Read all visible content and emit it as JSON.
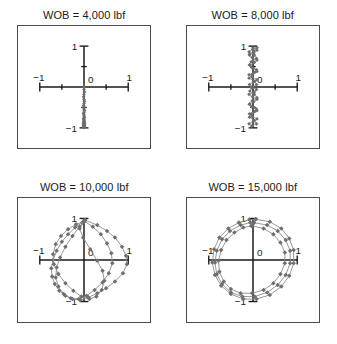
{
  "figure": {
    "background_color": "#ffffff",
    "frame_color": "#4a4a4a",
    "axis_color": "#1a1a1a",
    "marker_color": "#6e6e6e",
    "line_color": "#8a8a8a"
  },
  "panels": [
    {
      "id": "panel-wob-4000",
      "title": "WOB = 4,000 lbf",
      "tick_labels": {
        "x_min": "−1",
        "x_max": "1",
        "y_min": "−1",
        "y_max": "1",
        "origin": "0"
      }
    },
    {
      "id": "panel-wob-8000",
      "title": "WOB = 8,000 lbf",
      "tick_labels": {
        "x_min": "−1",
        "x_max": "1",
        "y_min": "−1",
        "y_max": "1",
        "origin": "0"
      }
    },
    {
      "id": "panel-wob-10000",
      "title": "WOB = 10,000 lbf",
      "tick_labels": {
        "x_min": "−1",
        "x_max": "1",
        "y_min": "−1",
        "y_max": "1",
        "origin": "0"
      }
    },
    {
      "id": "panel-wob-15000",
      "title": "WOB = 15,000 lbf",
      "tick_labels": {
        "x_min": "−1",
        "x_max": "1",
        "y_min": "−1",
        "y_max": "1",
        "origin": "0"
      }
    }
  ],
  "chart_data": [
    {
      "type": "scatter",
      "title": "WOB = 4,000 lbf",
      "xlabel": "",
      "ylabel": "",
      "xlim": [
        -1,
        1
      ],
      "ylim": [
        -1,
        1
      ],
      "xticks": [
        -1,
        -0.5,
        0,
        0.5,
        1
      ],
      "xticklabels": [
        "−1",
        "",
        "0",
        "",
        "1"
      ],
      "yticks": [
        -1,
        -0.5,
        0,
        0.5,
        1
      ],
      "yticklabels": [
        "−1",
        "",
        "",
        "",
        "1"
      ],
      "grid": false,
      "legend": false,
      "marker": "diamond",
      "series": [
        {
          "name": "bit-center-orbit",
          "x": [
            0.0,
            0.0,
            0.01,
            0.0,
            -0.01,
            0.0,
            0.01,
            0.0,
            -0.01,
            0.0,
            0.0,
            0.01,
            0.0,
            -0.01,
            0.0,
            0.0,
            0.01,
            0.0,
            -0.01,
            0.0,
            0.0,
            0.0,
            0.01,
            0.0,
            -0.01,
            0.0,
            0.0,
            0.01,
            0.0,
            -0.01,
            0.0,
            0.0,
            0.01,
            0.0,
            -0.01,
            0.0,
            0.0,
            0.0,
            0.01,
            0.0,
            0.0,
            -0.01,
            0.0,
            0.0,
            0.01,
            0.0,
            -0.01,
            0.0,
            0.0,
            0.0
          ],
          "y": [
            0.0,
            -0.06,
            -0.12,
            -0.18,
            -0.24,
            -0.3,
            -0.35,
            -0.4,
            -0.45,
            -0.5,
            -0.54,
            -0.58,
            -0.62,
            -0.65,
            -0.68,
            -0.71,
            -0.74,
            -0.76,
            -0.78,
            -0.8,
            -0.82,
            -0.84,
            -0.85,
            -0.86,
            -0.87,
            -0.88,
            -0.89,
            -0.9,
            -0.91,
            -0.92,
            -0.92,
            -0.93,
            -0.93,
            -0.94,
            -0.94,
            -0.95,
            -0.95,
            -0.96,
            -0.96,
            -0.96,
            -0.97,
            -0.97,
            -0.97,
            -0.98,
            -0.98,
            -0.98,
            -0.98,
            -0.99,
            -0.99,
            -0.99
          ]
        }
      ]
    },
    {
      "type": "scatter",
      "title": "WOB = 8,000 lbf",
      "xlabel": "",
      "ylabel": "",
      "xlim": [
        -1,
        1
      ],
      "ylim": [
        -1,
        1
      ],
      "xticks": [
        -1,
        -0.5,
        0,
        0.5,
        1
      ],
      "xticklabels": [
        "−1",
        "",
        "0",
        "",
        "1"
      ],
      "yticks": [
        -1,
        -0.5,
        0,
        0.5,
        1
      ],
      "yticklabels": [
        "−1",
        "",
        "",
        "",
        "1"
      ],
      "grid": false,
      "legend": false,
      "marker": "diamond",
      "series": [
        {
          "name": "bit-center-orbit",
          "x": [
            0.0,
            0.09,
            0.02,
            -0.08,
            -0.02,
            0.09,
            0.03,
            -0.07,
            -0.03,
            0.08,
            0.04,
            -0.09,
            -0.02,
            0.09,
            0.01,
            -0.08,
            -0.04,
            0.08,
            0.03,
            -0.09,
            -0.01,
            0.09,
            0.02,
            -0.08,
            -0.03,
            0.08,
            0.04,
            -0.08,
            -0.02,
            0.09,
            0.01,
            -0.09,
            -0.03,
            0.08,
            0.03,
            -0.08,
            -0.04,
            0.09,
            0.02,
            -0.08,
            -0.02,
            0.09,
            0.03,
            -0.07,
            -0.03,
            0.08,
            0.04,
            -0.09,
            -0.02,
            0.09,
            0.01,
            -0.08,
            -0.04,
            0.08,
            0.03,
            -0.09,
            -0.01,
            0.09,
            0.02,
            -0.08
          ],
          "y": [
            0.96,
            0.9,
            0.84,
            0.78,
            0.72,
            0.66,
            0.6,
            0.54,
            0.48,
            0.42,
            0.36,
            0.3,
            0.24,
            0.18,
            0.12,
            0.06,
            0.0,
            -0.06,
            -0.12,
            -0.18,
            -0.24,
            -0.3,
            -0.36,
            -0.42,
            -0.48,
            -0.54,
            -0.6,
            -0.66,
            -0.72,
            -0.78,
            -0.84,
            -0.9,
            -0.96,
            -0.9,
            -0.82,
            -0.74,
            -0.66,
            -0.58,
            -0.5,
            -0.42,
            -0.34,
            -0.26,
            -0.18,
            -0.1,
            -0.02,
            0.06,
            0.14,
            0.22,
            0.3,
            0.38,
            0.46,
            0.54,
            0.62,
            0.7,
            0.78,
            0.86,
            0.92,
            0.96,
            0.88,
            0.8
          ]
        }
      ]
    },
    {
      "type": "scatter",
      "title": "WOB = 10,000 lbf",
      "xlabel": "",
      "ylabel": "",
      "xlim": [
        -1,
        1
      ],
      "ylim": [
        -1,
        1
      ],
      "xticks": [
        -1,
        0,
        1
      ],
      "xticklabels": [
        "−1",
        "0",
        "1"
      ],
      "yticks": [
        -1,
        1
      ],
      "yticklabels": [
        "−1",
        "1"
      ],
      "grid": false,
      "legend": false,
      "marker": "diamond",
      "series": [
        {
          "name": "orbit-loop-outer",
          "x": [
            0.02,
            0.3,
            0.52,
            0.7,
            0.86,
            0.95,
            0.97,
            0.88,
            0.7,
            0.5,
            0.3,
            0.1,
            -0.08,
            -0.26,
            -0.42,
            -0.56,
            -0.66,
            -0.72,
            -0.74,
            -0.7,
            -0.62,
            -0.5,
            -0.36,
            -0.2,
            -0.04,
            0.02
          ],
          "y": [
            0.96,
            0.84,
            0.7,
            0.54,
            0.32,
            0.1,
            -0.1,
            -0.32,
            -0.52,
            -0.68,
            -0.8,
            -0.9,
            -0.96,
            -0.94,
            -0.86,
            -0.74,
            -0.58,
            -0.4,
            -0.2,
            0.0,
            0.22,
            0.44,
            0.62,
            0.78,
            0.9,
            0.96
          ]
        },
        {
          "name": "orbit-loop-inner",
          "x": [
            0.0,
            0.2,
            0.38,
            0.52,
            0.62,
            0.64,
            0.56,
            0.42,
            0.24,
            0.06,
            -0.12,
            -0.3,
            -0.46,
            -0.58,
            -0.64,
            -0.62,
            -0.54,
            -0.42,
            -0.26,
            -0.1,
            0.0
          ],
          "y": [
            0.94,
            0.8,
            0.62,
            0.4,
            0.16,
            -0.08,
            -0.32,
            -0.54,
            -0.72,
            -0.86,
            -0.94,
            -0.92,
            -0.82,
            -0.64,
            -0.42,
            -0.18,
            0.06,
            0.32,
            0.58,
            0.8,
            0.94
          ]
        },
        {
          "name": "orbit-loop-cross",
          "x": [
            0.0,
            -0.18,
            -0.36,
            -0.52,
            -0.64,
            -0.7,
            -0.68,
            -0.58,
            -0.42,
            -0.24,
            -0.06,
            0.12,
            0.28,
            0.4,
            0.46,
            0.42,
            0.3,
            0.14,
            -0.02,
            -0.1,
            0.0
          ],
          "y": [
            0.92,
            0.86,
            0.74,
            0.58,
            0.38,
            0.14,
            -0.1,
            -0.34,
            -0.56,
            -0.74,
            -0.88,
            -0.94,
            -0.88,
            -0.72,
            -0.5,
            -0.26,
            -0.02,
            0.26,
            0.54,
            0.76,
            0.92
          ]
        }
      ]
    },
    {
      "type": "scatter",
      "title": "WOB = 15,000 lbf",
      "xlabel": "",
      "ylabel": "",
      "xlim": [
        -1,
        1
      ],
      "ylim": [
        -1,
        1
      ],
      "xticks": [
        -1,
        0,
        1
      ],
      "xticklabels": [
        "−1",
        "0",
        "1"
      ],
      "yticks": [
        -1,
        1
      ],
      "yticklabels": [
        "−1",
        "1"
      ],
      "grid": false,
      "legend": false,
      "marker": "diamond",
      "series": [
        {
          "name": "orbit-ring-outer",
          "x": [
            0.06,
            0.38,
            0.64,
            0.82,
            0.92,
            0.92,
            0.82,
            0.64,
            0.38,
            0.08,
            -0.22,
            -0.5,
            -0.72,
            -0.86,
            -0.92,
            -0.88,
            -0.76,
            -0.56,
            -0.32,
            -0.08,
            0.06
          ],
          "y": [
            0.98,
            0.92,
            0.76,
            0.52,
            0.24,
            -0.08,
            -0.38,
            -0.64,
            -0.84,
            -0.94,
            -0.94,
            -0.82,
            -0.62,
            -0.36,
            -0.06,
            0.26,
            0.54,
            0.76,
            0.9,
            0.97,
            0.98
          ]
        },
        {
          "name": "orbit-ring-middle",
          "x": [
            0.02,
            0.32,
            0.56,
            0.74,
            0.84,
            0.84,
            0.74,
            0.56,
            0.32,
            0.04,
            -0.24,
            -0.5,
            -0.7,
            -0.82,
            -0.86,
            -0.82,
            -0.7,
            -0.52,
            -0.28,
            -0.06,
            0.02
          ],
          "y": [
            0.9,
            0.84,
            0.7,
            0.48,
            0.22,
            -0.08,
            -0.36,
            -0.6,
            -0.78,
            -0.88,
            -0.88,
            -0.78,
            -0.58,
            -0.34,
            -0.06,
            0.22,
            0.5,
            0.7,
            0.84,
            0.9,
            0.9
          ]
        },
        {
          "name": "orbit-ring-inner",
          "x": [
            -0.02,
            0.24,
            0.46,
            0.62,
            0.72,
            0.72,
            0.62,
            0.46,
            0.24,
            -0.02,
            -0.28,
            -0.5,
            -0.66,
            -0.76,
            -0.78,
            -0.72,
            -0.6,
            -0.42,
            -0.22,
            -0.04,
            -0.02
          ],
          "y": [
            0.82,
            0.76,
            0.62,
            0.42,
            0.18,
            -0.08,
            -0.34,
            -0.56,
            -0.72,
            -0.8,
            -0.8,
            -0.7,
            -0.52,
            -0.28,
            -0.02,
            0.24,
            0.48,
            0.66,
            0.78,
            0.82,
            0.82
          ]
        }
      ]
    }
  ]
}
